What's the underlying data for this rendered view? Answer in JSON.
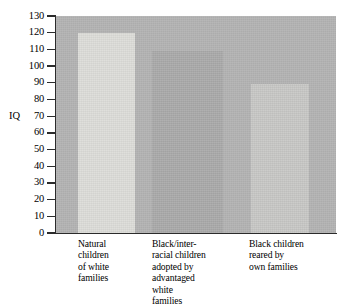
{
  "chart_data": {
    "type": "bar",
    "title": "",
    "xlabel": "",
    "ylabel": "IQ",
    "ylim": [
      0,
      130
    ],
    "ytick_step": 10,
    "yticks": [
      130,
      120,
      110,
      100,
      90,
      80,
      70,
      60,
      50,
      40,
      30,
      20,
      10,
      0
    ],
    "grid": false,
    "legend": "none",
    "categories": [
      "Natural\nchildren\nof white\nfamilies",
      "Black/inter-\nracial children\nadopted by\nadvantaged\nwhite\nfamilies",
      "Black children\nreared by\nown families"
    ],
    "values": [
      120,
      109,
      89
    ],
    "bar_colors": [
      "#dcdcd8",
      "#a9a9a9",
      "#c7c7c5"
    ],
    "plot_background": "#b3b3b3",
    "page_background": "#ffffff",
    "axis_color": "#2b2b2b"
  },
  "axis": {
    "y_title": "IQ",
    "tick_labels": [
      "130",
      "120",
      "110",
      "100",
      "90",
      "80",
      "70",
      "60",
      "50",
      "40",
      "30",
      "20",
      "10",
      "0"
    ]
  },
  "bars": [
    {
      "name": "natural-children-white-families",
      "value": 120,
      "label": "Natural\nchildren\nof white\nfamilies",
      "color": "#dcdcd8"
    },
    {
      "name": "black-interracial-adopted",
      "value": 109,
      "label": "Black/inter-\nracial children\nadopted by\nadvantaged\nwhite\nfamilies",
      "color": "#a9a9a9"
    },
    {
      "name": "black-children-own-families",
      "value": 89,
      "label": "Black children\nreared by\nown families",
      "color": "#c7c7c5"
    }
  ]
}
